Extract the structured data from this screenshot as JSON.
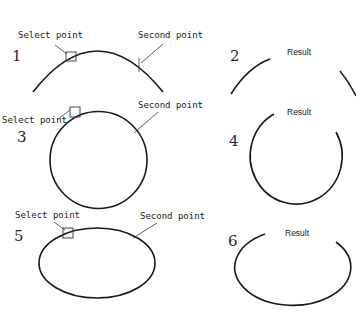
{
  "panels": [
    {
      "number": "1",
      "shape": "arc",
      "labels": {
        "select": "Select point",
        "second": "Second point"
      }
    },
    {
      "number": "2",
      "shape": "arc-broken",
      "labels": {
        "result": "Result"
      }
    },
    {
      "number": "3",
      "shape": "circle",
      "labels": {
        "select": "Select point",
        "second": "Second point"
      }
    },
    {
      "number": "4",
      "shape": "circle-broken",
      "labels": {
        "result": "Result"
      }
    },
    {
      "number": "5",
      "shape": "ellipse",
      "labels": {
        "select": "Select point",
        "second": "Second point"
      }
    },
    {
      "number": "6",
      "shape": "ellipse-broken",
      "labels": {
        "result": "Result"
      }
    }
  ],
  "colors": {
    "line": "#1a1a1a",
    "background": "#ffffff"
  }
}
